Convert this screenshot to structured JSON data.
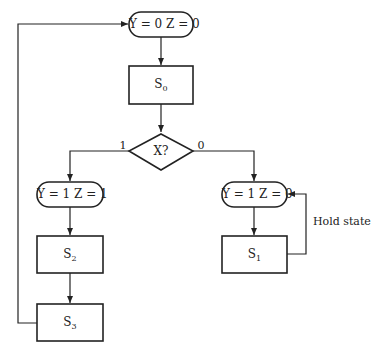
{
  "diagram": {
    "type": "ASM chart / flowchart",
    "nodes": [
      {
        "id": "out0",
        "shape": "terminal",
        "text": "Y = 0  Z = 0"
      },
      {
        "id": "s0",
        "shape": "rect",
        "base": "S",
        "sub": "0"
      },
      {
        "id": "dec",
        "shape": "diamond",
        "text": "X?"
      },
      {
        "id": "out1",
        "shape": "terminal",
        "text": "Y = 1  Z = 1"
      },
      {
        "id": "s2",
        "shape": "rect",
        "base": "S",
        "sub": "2"
      },
      {
        "id": "s3",
        "shape": "rect",
        "base": "S",
        "sub": "3"
      },
      {
        "id": "out2",
        "shape": "terminal",
        "text": "Y = 1  Z = 0"
      },
      {
        "id": "s1",
        "shape": "rect",
        "base": "S",
        "sub": "1"
      }
    ],
    "branch_labels": {
      "true": "1",
      "false": "0"
    },
    "hold_label": "Hold state"
  }
}
